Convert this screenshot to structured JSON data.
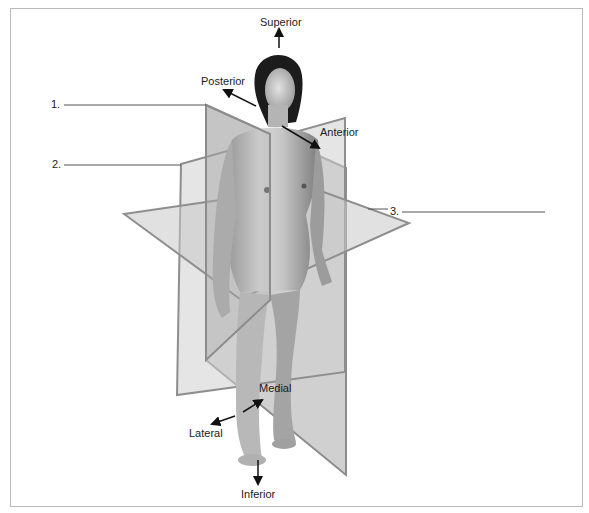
{
  "figure": {
    "directions": {
      "superior": "Superior",
      "inferior": "Inferior",
      "anterior": "Anterior",
      "posterior": "Posterior",
      "medial": "Medial",
      "lateral": "Lateral"
    },
    "blanks": [
      {
        "number": "1.",
        "answer": ""
      },
      {
        "number": "2.",
        "answer": ""
      },
      {
        "number": "3.",
        "answer": ""
      }
    ],
    "planes": [
      {
        "id": 1,
        "name": "sagittal-plane"
      },
      {
        "id": 2,
        "name": "frontal-plane"
      },
      {
        "id": 3,
        "name": "transverse-plane"
      }
    ]
  }
}
